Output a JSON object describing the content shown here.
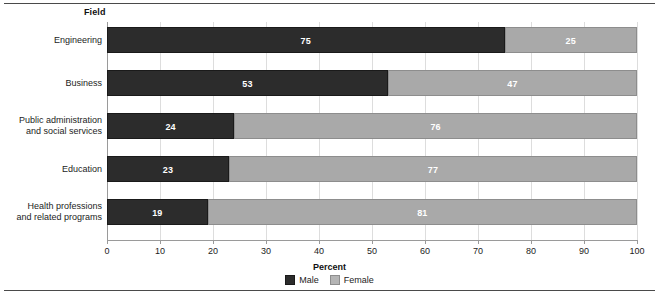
{
  "figure": {
    "field_title": "Field",
    "axis_title": "Percent"
  },
  "legend": {
    "items": [
      {
        "label": "Male",
        "color": "#2c2c2c",
        "swatch": "male-swatch"
      },
      {
        "label": "Female",
        "color": "#a9a9a9",
        "swatch": "female-swatch"
      }
    ]
  },
  "chart_data": {
    "type": "bar",
    "orientation": "horizontal",
    "stacked": true,
    "normalized": true,
    "title": "",
    "subtitle": "",
    "xlabel": "Percent",
    "ylabel": "Field",
    "xlim": [
      0,
      100
    ],
    "xticks": [
      0,
      10,
      20,
      30,
      40,
      50,
      60,
      70,
      80,
      90,
      100
    ],
    "xticklabels": [
      "0",
      "10",
      "20",
      "30",
      "40",
      "50",
      "60",
      "70",
      "80",
      "90",
      "100"
    ],
    "grid": true,
    "legend_position": "bottom-center",
    "categories": [
      "Engineering",
      "Business",
      "Public administration and social services",
      "Education",
      "Health professions and related programs"
    ],
    "category_lines": [
      [
        "Engineering"
      ],
      [
        "Business"
      ],
      [
        "Public administration",
        "and social services"
      ],
      [
        "Education"
      ],
      [
        "Health professions",
        "and related programs"
      ]
    ],
    "series": [
      {
        "name": "Male",
        "color": "#2c2c2c",
        "values": [
          75,
          53,
          24,
          23,
          19
        ]
      },
      {
        "name": "Female",
        "color": "#a9a9a9",
        "values": [
          25,
          47,
          76,
          77,
          81
        ]
      }
    ]
  },
  "ticks": [
    {
      "label": "0",
      "value": 0
    },
    {
      "label": "10",
      "value": 10
    },
    {
      "label": "20",
      "value": 20
    },
    {
      "label": "30",
      "value": 30
    },
    {
      "label": "40",
      "value": 40
    },
    {
      "label": "50",
      "value": 50
    },
    {
      "label": "60",
      "value": 60
    },
    {
      "label": "70",
      "value": 70
    },
    {
      "label": "80",
      "value": 80
    },
    {
      "label": "90",
      "value": 90
    },
    {
      "label": "100",
      "value": 100
    }
  ],
  "bars": [
    {
      "category_line_1": "Engineering",
      "category_line_2": "",
      "male_value": "75",
      "female_value": "25",
      "male": 75,
      "female": 25
    },
    {
      "category_line_1": "Business",
      "category_line_2": "",
      "male_value": "53",
      "female_value": "47",
      "male": 53,
      "female": 47
    },
    {
      "category_line_1": "Public administration",
      "category_line_2": "and social services",
      "male_value": "24",
      "female_value": "76",
      "male": 24,
      "female": 76
    },
    {
      "category_line_1": "Education",
      "category_line_2": "",
      "male_value": "23",
      "female_value": "77",
      "male": 23,
      "female": 77
    },
    {
      "category_line_1": "Health professions",
      "category_line_2": "and related programs",
      "male_value": "19",
      "female_value": "81",
      "male": 19,
      "female": 81
    }
  ]
}
